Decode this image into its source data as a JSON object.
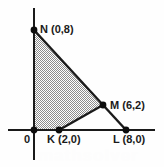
{
  "figure": {
    "background_color": "#fefefe",
    "line_color": "#1a1a1a",
    "fill_color": "#b0b0b0",
    "watermark_text": "mathsolver"
  },
  "axes": {
    "origin_label": "0",
    "x_axis": {
      "name": "x-axis",
      "y_px": 130,
      "x_start_px": 8,
      "x_end_px": 155
    },
    "y_axis": {
      "name": "y-axis",
      "x_px": 34,
      "y_start_px": 8,
      "y_end_px": 160
    }
  },
  "points": [
    {
      "id": "N",
      "label": "N (0,8)",
      "x": 0,
      "y": 8,
      "px": 34,
      "py": 30
    },
    {
      "id": "M",
      "label": "M (6,2)",
      "x": 6,
      "y": 2,
      "px": 103,
      "py": 105
    },
    {
      "id": "K",
      "label": "K (2,0)",
      "x": 2,
      "y": 0,
      "px": 59,
      "py": 130
    },
    {
      "id": "L",
      "label": "L (8,0)",
      "x": 8,
      "y": 0,
      "px": 126,
      "py": 130
    }
  ],
  "shaded_region": {
    "name": "shaded-quadrilateral",
    "vertices": [
      "O",
      "N",
      "M",
      "K"
    ],
    "points_px": "34,130 34,30 103,105 59,130"
  },
  "segments": [
    {
      "name": "segment-N-M",
      "from": "N",
      "to": "M"
    },
    {
      "name": "segment-M-K",
      "from": "M",
      "to": "K"
    },
    {
      "name": "segment-M-L",
      "from": "M",
      "to": "L"
    }
  ],
  "labels": {
    "N": "N (0,8)",
    "M": "M (6,2)",
    "K": "K (2,0)",
    "L": "L (8,0)",
    "origin": "0"
  }
}
